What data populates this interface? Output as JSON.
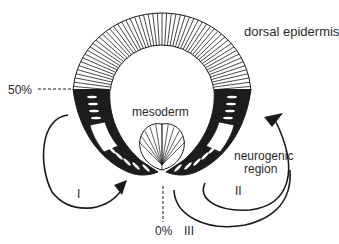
{
  "labels": {
    "dorsal_epidermis": "dorsal epidermis",
    "mesoderm": "mesoderm",
    "neurogenic_region": [
      "neurogenic",
      "region"
    ],
    "pct_50": "50%",
    "pct_0": "0%",
    "arrow_I": "I",
    "arrow_II": "II",
    "arrow_III": "III"
  },
  "colors": {
    "ink": "#1a1a1a",
    "cell_fill": "#ffffff",
    "dark_band": "#1c1c1c"
  }
}
